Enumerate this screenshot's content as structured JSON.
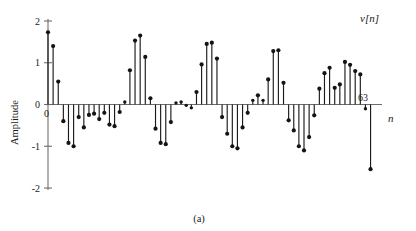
{
  "figure": {
    "caption": "(a)",
    "signal_label": "v[n]",
    "y_axis_label": "Amplitude",
    "x_axis_label": "n",
    "x_origin_label": "0",
    "x_end_label": "63"
  },
  "chart_data": {
    "type": "line",
    "plot_style": "stem",
    "title": "",
    "subtitle": "",
    "xlabel": "n",
    "ylabel": "Amplitude",
    "annotations": [
      "v[n]",
      "(a)",
      "0",
      "63"
    ],
    "grid": false,
    "legend": "none",
    "xlim": [
      0,
      63
    ],
    "ylim": [
      -2,
      2
    ],
    "ytick_labels": [
      "2",
      "1",
      "0",
      "-1",
      "-2"
    ],
    "yticks": [
      2,
      1,
      0,
      -1,
      -2
    ],
    "xtick_labels": [
      "0",
      "63"
    ],
    "xticks": [
      0,
      63
    ],
    "x": [
      0,
      1,
      2,
      3,
      4,
      5,
      6,
      7,
      8,
      9,
      10,
      11,
      12,
      13,
      14,
      15,
      16,
      17,
      18,
      19,
      20,
      21,
      22,
      23,
      24,
      25,
      26,
      27,
      28,
      29,
      30,
      31,
      32,
      33,
      34,
      35,
      36,
      37,
      38,
      39,
      40,
      41,
      42,
      43,
      44,
      45,
      46,
      47,
      48,
      49,
      50,
      51,
      52,
      53,
      54,
      55,
      56,
      57,
      58,
      59,
      60,
      61,
      62,
      63
    ],
    "values": [
      1.73,
      1.4,
      0.55,
      -0.4,
      -0.92,
      -1.0,
      -0.3,
      -0.55,
      -0.25,
      -0.22,
      -0.35,
      -0.2,
      -0.48,
      -0.52,
      -0.18,
      0.06,
      0.82,
      1.53,
      1.65,
      1.14,
      0.15,
      -0.58,
      -0.92,
      -0.95,
      -0.42,
      0.04,
      0.06,
      -0.02,
      -0.08,
      0.3,
      0.96,
      1.45,
      1.48,
      1.1,
      -0.3,
      -0.7,
      -1.0,
      -1.05,
      -0.55,
      -0.2,
      0.1,
      0.22,
      0.1,
      0.6,
      1.28,
      1.3,
      0.52,
      -0.38,
      -0.62,
      -1.0,
      -1.1,
      -0.78,
      -0.26,
      0.38,
      0.75,
      0.88,
      0.4,
      0.48,
      1.02,
      0.95,
      0.8,
      0.72,
      -0.1,
      -1.55
    ],
    "series": [
      {
        "name": "v[n]",
        "values": [
          1.73,
          1.4,
          0.55,
          -0.4,
          -0.92,
          -1.0,
          -0.3,
          -0.55,
          -0.25,
          -0.22,
          -0.35,
          -0.2,
          -0.48,
          -0.52,
          -0.18,
          0.06,
          0.82,
          1.53,
          1.65,
          1.14,
          0.15,
          -0.58,
          -0.92,
          -0.95,
          -0.42,
          0.04,
          0.06,
          -0.02,
          -0.08,
          0.3,
          0.96,
          1.45,
          1.48,
          1.1,
          -0.3,
          -0.7,
          -1.0,
          -1.05,
          -0.55,
          -0.2,
          0.1,
          0.22,
          0.1,
          0.6,
          1.28,
          1.3,
          0.52,
          -0.38,
          -0.62,
          -1.0,
          -1.1,
          -0.78,
          -0.26,
          0.38,
          0.75,
          0.88,
          0.4,
          0.48,
          1.02,
          0.95,
          0.8,
          0.72,
          -0.1,
          -1.55
        ]
      }
    ]
  },
  "geometry": {
    "plot_left": 48,
    "plot_right": 376,
    "y_top_px": 21,
    "y_zero_px": 104.5,
    "y_bottom_px": 188,
    "axis_x_px": 48,
    "stem_spacing": 5.12
  },
  "colors": {
    "stem": "#141414",
    "axis": "#6d6d6d",
    "background": "#ffffff"
  }
}
